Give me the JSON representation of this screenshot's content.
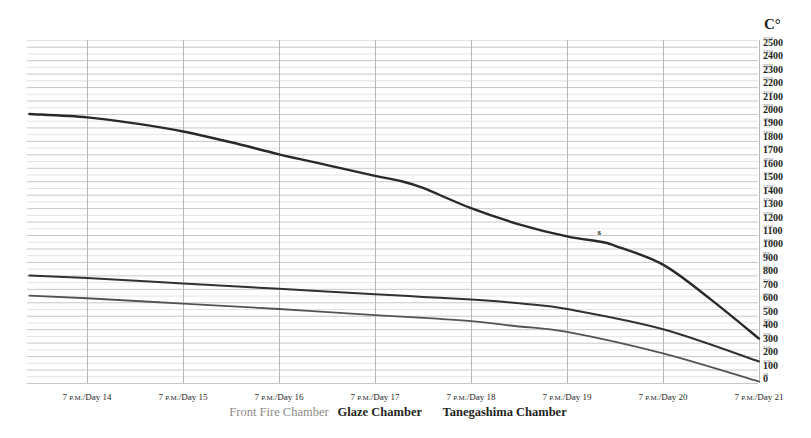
{
  "chart_data": {
    "type": "line",
    "title": "",
    "xlabel": "",
    "ylabel": "C°",
    "ylim": [
      0,
      2550
    ],
    "grid": true,
    "legend_position": "below-axis",
    "y_tick_step_major": 100,
    "y_tick_step_minor": 50,
    "x_categories": [
      "7 P.M./Day 14",
      "7 P.M./Day 15",
      "7 P.M./Day 16",
      "7 P.M./Day 17",
      "7 P.M./Day 18",
      "7 P.M./Day 19",
      "7 P.M./Day 20",
      "7 P.M./Day 21"
    ],
    "x_days": [
      14,
      15,
      16,
      17,
      18,
      19,
      20,
      21
    ],
    "series": [
      {
        "name": "Front Fire Chamber",
        "color": "#2b2827",
        "width": 2.4,
        "x": [
          13.4,
          14.0,
          14.5,
          15.0,
          15.5,
          16.0,
          16.5,
          17.0,
          17.25,
          17.5,
          18.0,
          18.5,
          19.0,
          19.35,
          19.5,
          20.0,
          20.5,
          21.0
        ],
        "values": [
          2000,
          1975,
          1930,
          1870,
          1790,
          1700,
          1620,
          1540,
          1505,
          1450,
          1300,
          1180,
          1090,
          1050,
          1020,
          880,
          620,
          330
        ]
      },
      {
        "name": "Glaze Chamber",
        "color": "#33302f",
        "width": 2.0,
        "x": [
          13.4,
          14.0,
          15.0,
          16.0,
          17.0,
          17.5,
          18.0,
          18.3,
          18.6,
          19.0,
          20.0,
          21.0
        ],
        "values": [
          800,
          780,
          740,
          700,
          660,
          640,
          620,
          605,
          585,
          550,
          400,
          160
        ]
      },
      {
        "name": "Tanegashima Chamber",
        "color": "#575352",
        "width": 1.8,
        "x": [
          13.4,
          14.0,
          15.0,
          16.0,
          17.0,
          17.6,
          18.0,
          18.5,
          19.0,
          20.0,
          21.0
        ],
        "values": [
          650,
          630,
          590,
          550,
          505,
          480,
          460,
          420,
          380,
          220,
          10
        ]
      }
    ],
    "annotations": [
      {
        "label": "s",
        "x": 19.35,
        "y": 1075
      }
    ]
  },
  "axis": {
    "unit_label": "C°",
    "major_labels": [
      2500,
      2400,
      2300,
      2200,
      2100,
      2000,
      1900,
      1800,
      1700,
      1600,
      1500,
      1400,
      1300,
      1200,
      1100,
      1000,
      900,
      800,
      700,
      600,
      500,
      400,
      300,
      200,
      100,
      0
    ],
    "minor_labels": [
      2550,
      2450,
      2350,
      2250,
      2150,
      2050,
      1950,
      1850,
      1750,
      1650,
      1550,
      1450,
      1350,
      1250,
      1150,
      1050,
      950,
      850,
      750,
      650,
      550,
      450,
      350,
      250,
      150,
      50
    ]
  },
  "legend": {
    "items": [
      {
        "label": "Front Fire Chamber",
        "style": "light",
        "x_day": 16.0
      },
      {
        "label": "Glaze Chamber",
        "style": "dark",
        "x_day": 17.05
      },
      {
        "label": "Tanegashima Chamber",
        "style": "dark",
        "x_day": 18.35
      }
    ]
  }
}
